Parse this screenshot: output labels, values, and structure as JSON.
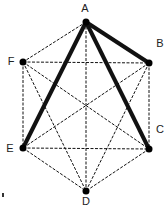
{
  "diagram": {
    "nodes": [
      {
        "id": "A",
        "label": "A",
        "x": 86,
        "y": 22,
        "lx": 85,
        "ly": 12
      },
      {
        "id": "B",
        "label": "B",
        "x": 149,
        "y": 63,
        "lx": 160,
        "ly": 47
      },
      {
        "id": "C",
        "label": "C",
        "x": 149,
        "y": 149,
        "lx": 160,
        "ly": 133
      },
      {
        "id": "D",
        "label": "D",
        "x": 86,
        "y": 191,
        "lx": 86,
        "ly": 205
      },
      {
        "id": "E",
        "label": "E",
        "x": 23,
        "y": 148,
        "lx": 10,
        "ly": 152
      },
      {
        "id": "F",
        "label": "F",
        "x": 23,
        "y": 62,
        "lx": 11,
        "ly": 65
      }
    ],
    "bold_edges": [
      [
        "A",
        "B"
      ],
      [
        "A",
        "C"
      ],
      [
        "A",
        "E"
      ]
    ],
    "dashed_edges": [
      [
        "A",
        "F"
      ],
      [
        "A",
        "D"
      ],
      [
        "F",
        "B"
      ],
      [
        "F",
        "C"
      ],
      [
        "F",
        "D"
      ],
      [
        "F",
        "E"
      ],
      [
        "B",
        "E"
      ],
      [
        "B",
        "D"
      ],
      [
        "B",
        "C"
      ],
      [
        "E",
        "C"
      ],
      [
        "E",
        "D"
      ],
      [
        "C",
        "D"
      ]
    ],
    "colors": {
      "line": "#111111",
      "node": "#000000",
      "background": "#ffffff"
    }
  }
}
